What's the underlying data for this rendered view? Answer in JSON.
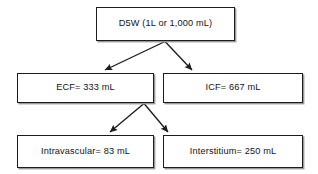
{
  "diagram": {
    "type": "flowchart",
    "line_color": "#1c1c1c",
    "box_fill": "#ffffff",
    "background": "#ffffff",
    "nodes": [
      {
        "id": "source",
        "label": "D5W (1L or 1,000 mL)",
        "level": 0
      },
      {
        "id": "ecf",
        "label": "ECF= 333 mL",
        "level": 1
      },
      {
        "id": "icf",
        "label": "ICF= 667 mL",
        "level": 1
      },
      {
        "id": "intravascular",
        "label": "Intravascular= 83 mL",
        "level": 2
      },
      {
        "id": "interstitium",
        "label": "Interstitium= 250 mL",
        "level": 2
      }
    ],
    "edges": [
      {
        "from": "source",
        "to": "ecf",
        "arrow": "end"
      },
      {
        "from": "source",
        "to": "icf",
        "arrow": "end"
      },
      {
        "from": "ecf",
        "to": "intravascular",
        "arrow": "end"
      },
      {
        "from": "ecf",
        "to": "interstitium",
        "arrow": "end"
      }
    ]
  }
}
